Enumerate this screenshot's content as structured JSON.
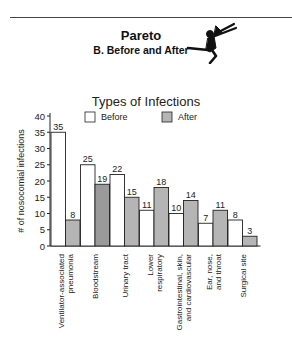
{
  "header": {
    "title": "Pareto",
    "subtitle": "B. Before and After",
    "icon": "running-figure-icon"
  },
  "colors": {
    "before_fill": "#ffffff",
    "after_fill": "#b5b5b5",
    "after_fill_dark": "#9a9a9a",
    "stroke": "#222222"
  },
  "chart_data": {
    "type": "bar",
    "title": "Types of Infections",
    "xlabel": "",
    "ylabel": "# of nosocomial infections",
    "ylim": [
      0,
      40
    ],
    "yticks": [
      0,
      5,
      10,
      15,
      20,
      25,
      30,
      35,
      40
    ],
    "legend": {
      "placement": "top",
      "entries": [
        "Before",
        "After"
      ]
    },
    "grid": false,
    "categories": [
      [
        "Ventilator-associated",
        "pneumonia"
      ],
      [
        "Bloodstream"
      ],
      [
        "Urinary tract"
      ],
      [
        "Lower",
        "respiratory"
      ],
      [
        "Gastrointestinal, skin,",
        "and cardiovascular"
      ],
      [
        "Ear, nose,",
        "and throat"
      ],
      [
        "Surgical site"
      ]
    ],
    "series": [
      {
        "name": "Before",
        "values": [
          35,
          25,
          22,
          11,
          10,
          7,
          8
        ]
      },
      {
        "name": "After",
        "values": [
          8,
          19,
          15,
          18,
          14,
          11,
          3
        ]
      }
    ]
  }
}
